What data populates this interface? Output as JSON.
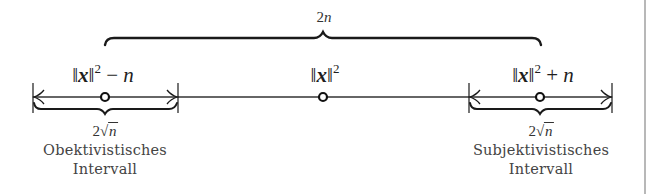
{
  "diagram": {
    "type": "number-line-interval-diagram",
    "top_brace": {
      "label": "2n",
      "label_coef": "2",
      "label_var": "n",
      "spans": [
        "||x||^2 - n",
        "||x||^2 + n"
      ]
    },
    "points": [
      {
        "id": "left",
        "label": "||x||^2 - n",
        "norm_open": "‖",
        "var": "x",
        "norm_close": "‖",
        "exp": "2",
        "op": " − ",
        "rhs": "n"
      },
      {
        "id": "center",
        "label": "||x||^2",
        "norm_open": "‖",
        "var": "x",
        "norm_close": "‖",
        "exp": "2"
      },
      {
        "id": "right",
        "label": "||x||^2 + n",
        "norm_open": "‖",
        "var": "x",
        "norm_close": "‖",
        "exp": "2",
        "op": " + ",
        "rhs": "n"
      }
    ],
    "intervals": [
      {
        "id": "objective",
        "width_label": "2√n",
        "width_coef": "2",
        "width_radicand": "n",
        "name_line1": "Obektivistisches",
        "name_line2": "Intervall"
      },
      {
        "id": "subjective",
        "width_label": "2√n",
        "width_coef": "2",
        "width_radicand": "n",
        "name_line1": "Subjektivistisches",
        "name_line2": "Intervall"
      }
    ],
    "colors": {
      "stroke": "#1a1a1a",
      "text": "#222222",
      "caption": "#444444",
      "frame_edge": "#b8b8b8"
    }
  }
}
